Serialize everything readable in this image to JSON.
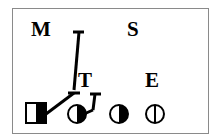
{
  "figure": {
    "labels": {
      "m": "M",
      "s": "S",
      "t": "T",
      "e": "E"
    },
    "symbols": [
      {
        "name": "half-filled-square",
        "fill": "right-half-black"
      },
      {
        "name": "half-filled-circle-right",
        "fill": "right-half-black"
      },
      {
        "name": "half-filled-circle-right-2",
        "fill": "right-half-black"
      },
      {
        "name": "circle-with-vertical-line",
        "fill": "none"
      }
    ],
    "colors": {
      "ink": "#000000",
      "frame": "#8a8a8a",
      "background": "#ffffff"
    }
  }
}
